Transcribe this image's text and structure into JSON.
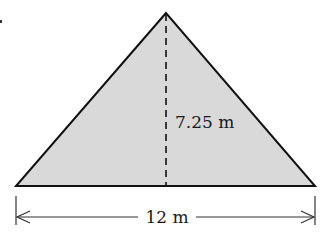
{
  "figure": {
    "shape": "isosceles-triangle",
    "fill_color": "#d9d9d9",
    "stroke_color": "#111111",
    "height_label": "7.25 m",
    "base_label": "12 m",
    "height_value": 7.25,
    "base_value": 12,
    "unit": "m"
  }
}
